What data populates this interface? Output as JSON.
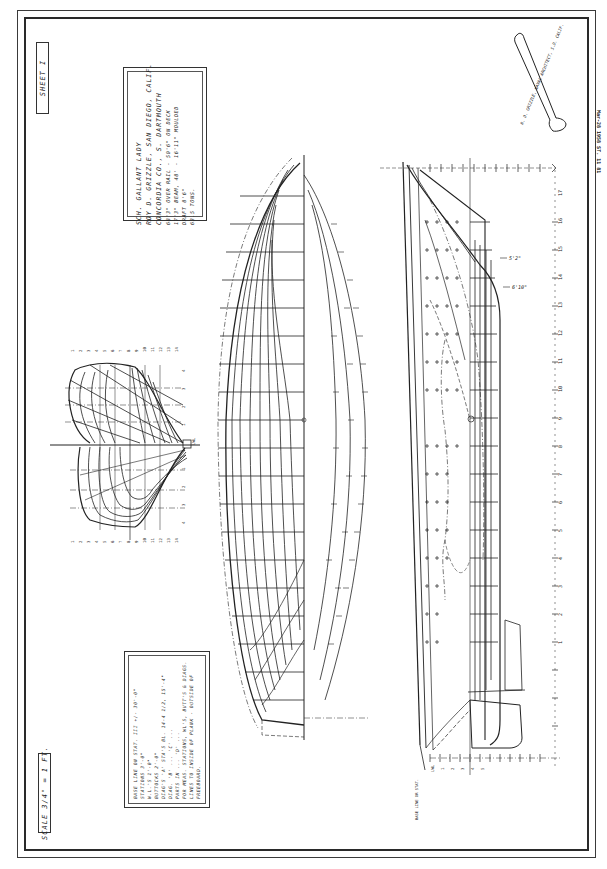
{
  "document": {
    "type": "lines plan",
    "sheet_label": "SHEET  I",
    "scale_label": "SCALE 3/4\" = 1 FT.",
    "colors": {
      "paper": "#ffffff",
      "ink": "#222222"
    }
  },
  "title_block": {
    "vessel": "SCH. GALLANT LADY",
    "owner": "ROY D. GRIZZLE, SAN DIEGO, CALIF.",
    "builder": "CONCORDIA CO., S. DARTMOUTH",
    "dimensions": [
      "68'3\" OVER RAIL - 50'6\" ON DECK",
      "17'3\" BEAM, 48' - 16'11\" MOULDED",
      "DRAFT 8'6\"",
      "63.5 TONS."
    ]
  },
  "notes_block": {
    "lines": [
      "BASE LINE ON STAT. III +/- 30'-0\"",
      "STATIONS 3'-0\"",
      "W.L.'S 1'-0\"",
      "BUTTOCKS 2'-0\"",
      "DIAG'S 'A' STA'S BL. 14-4 1/2, 15'-4\"",
      "DIAG. 'B' ... 'C' ...",
      "PARTS IN ... 'D' ...",
      "FOR MEAS. STATIONS, WL'S, BUTT'S & DIAGS.",
      "LINES TO INSIDE OF PLANK - OUTSIDE OF",
      "FREEBOARD."
    ]
  },
  "architect_banner": {
    "text": "R. D. GRIZZLE, NAVAL ARCHITECT, S.D. CALIF."
  },
  "side_strip": {
    "text": "Mar-28 1958   ST. 11 81"
  },
  "profile": {
    "dimension_labels": [
      "5'2\"",
      "6'10\""
    ],
    "station_labels": [
      "1",
      "2",
      "3",
      "4",
      "5",
      "6",
      "7",
      "8",
      "9",
      "10",
      "11",
      "12",
      "13",
      "14",
      "15",
      "16",
      "17"
    ],
    "waterline_labels": [
      "LWL",
      "1",
      "2",
      "3",
      "4",
      "5"
    ],
    "base_label": "BASE LINE OR STAT."
  },
  "body_plan": {
    "top_labels": [
      "1",
      "2",
      "3",
      "4",
      "5",
      "6",
      "7",
      "8",
      "9",
      "10",
      "11",
      "12",
      "13",
      "14"
    ],
    "bottom_labels": [
      "1",
      "2",
      "3",
      "4",
      "5",
      "6",
      "7",
      "8",
      "9",
      "10",
      "11",
      "12",
      "13",
      "14"
    ],
    "side_labels": [
      "4",
      "3",
      "2",
      "1",
      "LWL",
      "1",
      "2",
      "3",
      "4"
    ]
  }
}
